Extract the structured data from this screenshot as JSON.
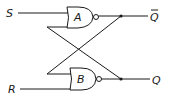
{
  "diagram": {
    "inputs": [
      {
        "label": "S"
      },
      {
        "label": "R"
      }
    ],
    "gates": [
      {
        "label": "A",
        "type": "NAND"
      },
      {
        "label": "B",
        "type": "NAND"
      }
    ],
    "outputs": [
      {
        "label": "Q",
        "overline": true
      },
      {
        "label": "Q",
        "overline": false
      }
    ],
    "colors": {
      "line": "#1a1a1a",
      "background": "#ffffff"
    }
  }
}
